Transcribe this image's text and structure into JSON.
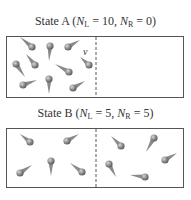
{
  "stateA": {
    "label": "State A",
    "nl_symbol": "N",
    "nl_sub": "L",
    "nl_value": "10",
    "nr_symbol": "N",
    "nr_sub": "R",
    "nr_value": "0",
    "velocity_label": "v"
  },
  "stateB": {
    "label": "State B",
    "nl_symbol": "N",
    "nl_sub": "L",
    "nl_value": "5",
    "nr_symbol": "N",
    "nr_sub": "R",
    "nr_value": "5"
  },
  "colors": {
    "box_border": "#555555",
    "molecule": "#8a8a8a",
    "molecule_highlight": "#d0d0d0",
    "text": "#333333"
  }
}
